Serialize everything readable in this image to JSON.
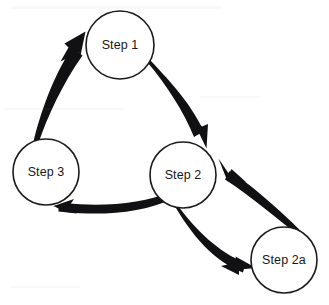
{
  "diagram": {
    "type": "cycle-flowchart",
    "title": "",
    "background_color": "#ffffff",
    "stroke_color": "#1b1b1b",
    "arrow_color": "#111114",
    "text_color": "#17171a",
    "nodes": [
      {
        "id": "step1",
        "label": "Step 1",
        "shape": "circle",
        "cx": 120,
        "cy": 45,
        "r": 34
      },
      {
        "id": "step3",
        "label": "Step 3",
        "shape": "circle",
        "cx": 46,
        "cy": 172,
        "r": 33
      },
      {
        "id": "step2",
        "label": "Step 2",
        "shape": "circle",
        "cx": 183,
        "cy": 175,
        "r": 33
      },
      {
        "id": "step2a",
        "label": "Step 2a",
        "shape": "circle",
        "cx": 284,
        "cy": 260,
        "r": 33
      }
    ],
    "edges": [
      {
        "id": "edge-step1-step2",
        "from": "Step 1",
        "to": "Step 2",
        "style": "curved-tapered-arrow",
        "direction": "clockwise"
      },
      {
        "id": "edge-step2-step2a",
        "from": "Step 2",
        "to": "Step 2a",
        "style": "curved-tapered-arrow",
        "direction": "down-right"
      },
      {
        "id": "edge-step2a-step2",
        "from": "Step 2a",
        "to": "Step 2",
        "style": "curved-tapered-arrow",
        "direction": "up-left"
      },
      {
        "id": "edge-step2-step3",
        "from": "Step 2",
        "to": "Step 3",
        "style": "curved-tapered-arrow",
        "direction": "left"
      },
      {
        "id": "edge-step3-step1",
        "from": "Step 3",
        "to": "Step 1",
        "style": "curved-tapered-arrow",
        "direction": "up-right"
      }
    ]
  }
}
